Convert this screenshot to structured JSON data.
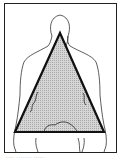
{
  "figure": {
    "shape": "triangle",
    "colors": {
      "frame": "#222222",
      "outline": "#333333",
      "triangle_stroke": "#111111",
      "triangle_fill": "#c8c8c8"
    },
    "caption": "····  ·······  ·····"
  }
}
